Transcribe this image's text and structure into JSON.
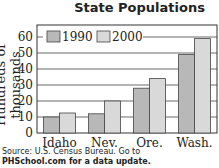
{
  "chart_data": {
    "type": "bar",
    "title": "State Populations",
    "xlabel": "",
    "ylabel": "Hundreds of thousands",
    "categories": [
      "Idaho",
      "Nev.",
      "Ore.",
      "Wash."
    ],
    "series": [
      {
        "name": "1990",
        "values": [
          10,
          12,
          28,
          49
        ],
        "color": "#b8b8b8"
      },
      {
        "name": "2000",
        "values": [
          12.5,
          20,
          34,
          59
        ],
        "color": "#d9d9d9"
      }
    ],
    "yticks": [
      0,
      10,
      20,
      30,
      40,
      50,
      60
    ],
    "ylim": [
      0,
      67
    ],
    "grid": true,
    "legend_position": "top-left inside"
  },
  "source_line1": "Source: U.S. Census Bureau. Go to",
  "source_line2": "PHSchool.com for a data update."
}
